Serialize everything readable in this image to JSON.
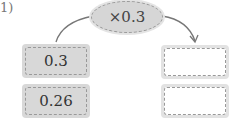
{
  "problem_number": "1)",
  "operator": {
    "label": "×0.3"
  },
  "inputs": [
    {
      "value": "0.3"
    },
    {
      "value": "0.26"
    }
  ],
  "outputs": [
    {
      "value": ""
    },
    {
      "value": ""
    }
  ],
  "colors": {
    "box_fill": "#d8d8d8",
    "border": "#999999",
    "arrow": "#777777"
  }
}
